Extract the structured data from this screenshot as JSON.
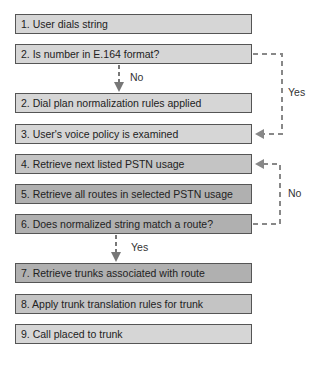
{
  "steps": [
    {
      "label": "1. User dials string"
    },
    {
      "label": "2. Is number in E.164 format?"
    },
    {
      "label": "2. Dial plan normalization rules applied"
    },
    {
      "label": "3. User's voice policy is examined"
    },
    {
      "label": "4. Retrieve next listed PSTN usage"
    },
    {
      "label": "5. Retrieve all routes in selected PSTN usage"
    },
    {
      "label": "6. Does normalized string match a route?"
    },
    {
      "label": "7. Retrieve trunks associated with route"
    },
    {
      "label": "8. Apply trunk translation rules for trunk"
    },
    {
      "label": "9. Call placed to trunk"
    }
  ],
  "branches": {
    "e164_no": "No",
    "e164_yes": "Yes",
    "match_no": "No",
    "match_yes": "Yes"
  },
  "colors": {
    "box_light": "#d6d6d6",
    "box_mid": "#c4c4c4",
    "box_dark": "#b0b0b0",
    "arrow": "#777777"
  }
}
